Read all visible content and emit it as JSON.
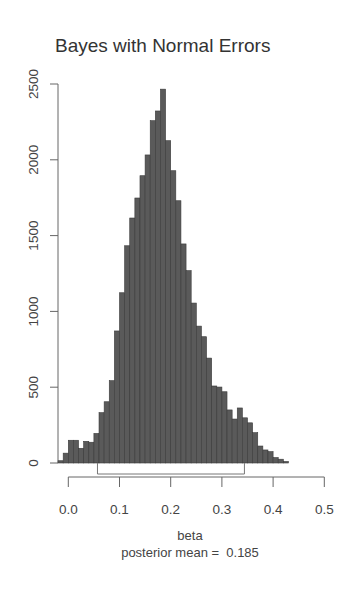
{
  "chart_data": {
    "type": "bar",
    "subtype": "histogram",
    "title": "Bayes with Normal Errors",
    "xlabel": "beta",
    "subtitle": "posterior mean =  0.185",
    "ylabel": "",
    "xlim": [
      -0.02,
      0.5
    ],
    "ylim": [
      0,
      2500
    ],
    "x_ticks": [
      "0.0",
      "0.1",
      "0.2",
      "0.3",
      "0.4",
      "0.5"
    ],
    "y_ticks": [
      "0",
      "500",
      "1000",
      "1500",
      "2000",
      "2500"
    ],
    "bin_width": 0.01,
    "bin_starts": [
      -0.02,
      -0.01,
      0.0,
      0.01,
      0.02,
      0.03,
      0.04,
      0.05,
      0.06,
      0.07,
      0.08,
      0.09,
      0.1,
      0.11,
      0.12,
      0.13,
      0.14,
      0.15,
      0.16,
      0.17,
      0.18,
      0.19,
      0.2,
      0.21,
      0.22,
      0.23,
      0.24,
      0.25,
      0.26,
      0.27,
      0.28,
      0.29,
      0.3,
      0.31,
      0.32,
      0.33,
      0.34,
      0.35,
      0.36,
      0.37,
      0.38,
      0.39,
      0.4,
      0.41,
      0.42
    ],
    "values": [
      15,
      65,
      150,
      150,
      97,
      143,
      137,
      195,
      332,
      404,
      543,
      871,
      1123,
      1433,
      1616,
      1748,
      1895,
      2032,
      2258,
      2322,
      2466,
      2126,
      1928,
      1730,
      1445,
      1269,
      1055,
      903,
      833,
      692,
      508,
      501,
      470,
      350,
      290,
      363,
      298,
      265,
      200,
      112,
      86,
      75,
      36,
      25,
      10
    ],
    "credible_interval": [
      0.057,
      0.344
    ],
    "posterior_mean": 0.185,
    "grid": false,
    "legend": null,
    "bar_color": "#5a5a5a"
  }
}
